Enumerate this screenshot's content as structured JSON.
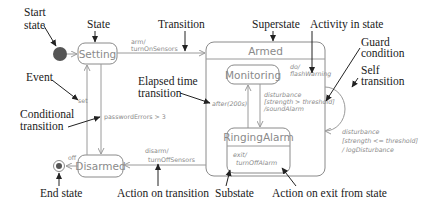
{
  "diagram": {
    "type": "UML state machine",
    "states": {
      "setting": "Setting",
      "armed": "Armed",
      "monitoring": "Monitoring",
      "ringing_alarm": "RingingAlarm",
      "disarmed": "Disarmed"
    },
    "activities": {
      "armed_do_1": "do/",
      "armed_do_2": "flashWarning",
      "ringing_exit_1": "exit/",
      "ringing_exit_2": "turnOffAlarm"
    },
    "transitions": {
      "arm_1": "arm/",
      "arm_2": "turnOnSensors",
      "set": "set",
      "password_errors": "passwordErrors > 3",
      "after": "after(200s)",
      "dist_1": "disturbance",
      "dist_2": "[strength > threshold]",
      "dist_3": "/soundAlarm",
      "self_1": "disturbance",
      "self_2": "[strength <= threshold]",
      "self_3": "/ logDisturbance",
      "disarm_1": "disarm/",
      "disarm_2": "turnOffSensors",
      "off": "off"
    },
    "annotations": {
      "start_state_1": "Start",
      "start_state_2": "state",
      "state": "State",
      "transition": "Transition",
      "superstate": "Superstate",
      "activity_in_state": "Activity in state",
      "guard_1": "Guard",
      "guard_2": "condition",
      "self_1": "Self",
      "self_2": "transition",
      "event": "Event",
      "elapsed_1": "Elapsed time",
      "elapsed_2": "transition",
      "conditional_1": "Conditional",
      "conditional_2": "transition",
      "end_state": "End state",
      "action_on_transition": "Action on transition",
      "substate": "Substate",
      "action_on_exit": "Action on exit from state"
    },
    "colors": {
      "state_stroke": "#8a8a8a",
      "line": "#9a9a9a",
      "start_fill": "#555555",
      "annotation_text": "#1a1a1a"
    }
  }
}
